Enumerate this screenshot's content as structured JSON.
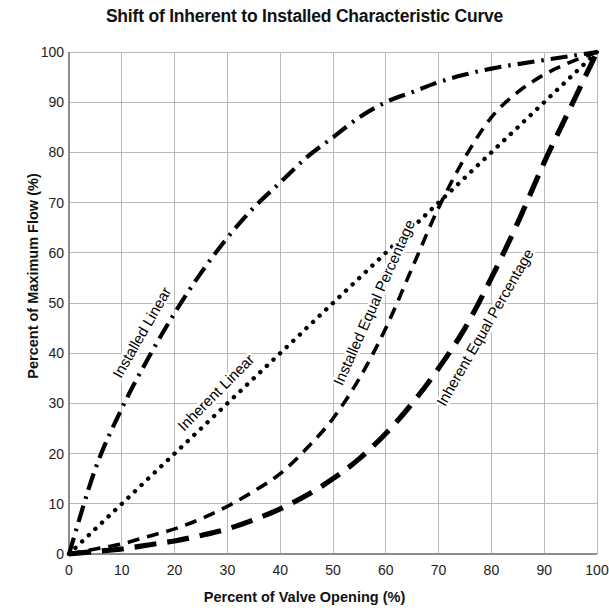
{
  "chart_data": {
    "type": "line",
    "title": "Shift of Inherent to Installed Characteristic Curve",
    "xlabel": "Percent of Valve Opening (%)",
    "ylabel": "Percent of Maximum Flow (%)",
    "xlim": [
      0,
      100
    ],
    "ylim": [
      0,
      100
    ],
    "xticks": [
      0,
      10,
      20,
      30,
      40,
      50,
      60,
      70,
      80,
      90,
      100
    ],
    "yticks": [
      0,
      10,
      20,
      30,
      40,
      50,
      60,
      70,
      80,
      90,
      100
    ],
    "grid": true,
    "legend_position": "inline-labels",
    "grid_color": "#b9b9b9",
    "line_color": "#000000",
    "x": [
      0,
      5,
      10,
      15,
      20,
      25,
      30,
      35,
      40,
      45,
      50,
      55,
      60,
      65,
      70,
      75,
      80,
      85,
      90,
      95,
      100
    ],
    "series": [
      {
        "name": "Installed Linear",
        "dash_style": "dash-dot",
        "label_text": "Installed Linear",
        "values": [
          0,
          17,
          29,
          39,
          48,
          56,
          63,
          69,
          74,
          79,
          83,
          87,
          90,
          92,
          94,
          95.5,
          96.7,
          97.6,
          98.4,
          99.2,
          100
        ]
      },
      {
        "name": "Inherent Linear",
        "dash_style": "dotted",
        "label_text": "Inherent Linear",
        "values": [
          0,
          5,
          10,
          15,
          20,
          25,
          30,
          35,
          40,
          45,
          50,
          55,
          60,
          65,
          70,
          75,
          80,
          85,
          90,
          95,
          100
        ]
      },
      {
        "name": "Installed Equal Percentage",
        "dash_style": "short-dash",
        "label_text": "Installed Equal Percentage",
        "values": [
          0,
          1,
          2,
          3.5,
          5,
          7,
          9.5,
          12.5,
          16,
          21,
          27,
          35,
          45,
          57,
          69,
          79,
          87,
          92,
          95.5,
          98,
          100
        ]
      },
      {
        "name": "Inherent Equal Percentage",
        "dash_style": "long-dash",
        "label_text": "Inherent Equal Percentage",
        "values": [
          0,
          0.5,
          1,
          1.8,
          2.6,
          3.7,
          5,
          6.8,
          9,
          11.7,
          15,
          19,
          24,
          30,
          37,
          45,
          55,
          66,
          78,
          89,
          100
        ]
      }
    ],
    "annotations": [
      {
        "text": "Installed Linear",
        "x": 14,
        "y": 44,
        "rotation": -60
      },
      {
        "text": "Inherent Linear",
        "x": 28,
        "y": 32,
        "rotation": -45
      },
      {
        "text": "Installed Equal Percentage",
        "x": 58,
        "y": 50,
        "rotation": -66
      },
      {
        "text": "Inherent Equal Percentage",
        "x": 79,
        "y": 45,
        "rotation": -60
      }
    ]
  }
}
